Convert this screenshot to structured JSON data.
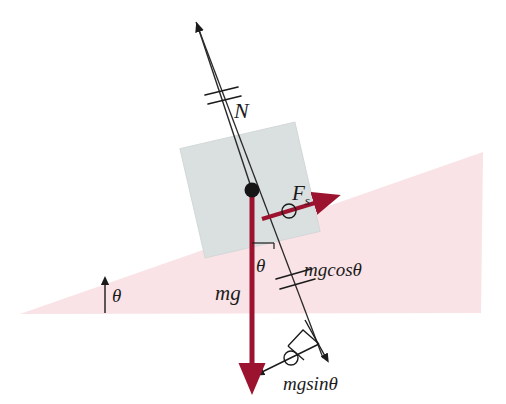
{
  "figure": {
    "domain": "physics-diagram"
  },
  "colors": {
    "incline_fill": "#f9e3e6",
    "block_fill": "#dadfe0",
    "block_stroke": "#c9cfd0",
    "force_red": "#9c1330",
    "line_black": "#1b1b1b",
    "background": "#ffffff"
  },
  "labels": {
    "normal_force": "N",
    "friction_force": "F",
    "friction_force_sub": "s",
    "weight": "mg",
    "weight_cos": "mgcosθ",
    "weight_sin": "mgsinθ",
    "angle_incline": "θ",
    "angle_weight": "θ"
  },
  "vectors": [
    {
      "name": "normal-force",
      "label": "N",
      "color": "#1b1b1b",
      "direction": "up-left",
      "tick_marks": 2,
      "from": [
        252,
        190
      ],
      "to": [
        196,
        22
      ]
    },
    {
      "name": "weight",
      "label": "mg",
      "color": "#9c1330",
      "direction": "down",
      "tick_marks": 0,
      "from": [
        252,
        190
      ],
      "to": [
        252,
        376
      ]
    },
    {
      "name": "static-friction",
      "label": "Fs",
      "color": "#9c1330",
      "direction": "up-right-along-incline",
      "tick_marks": 1,
      "from": [
        264,
        215
      ],
      "to": [
        322,
        200
      ]
    },
    {
      "name": "weight-component-perpendicular",
      "label": "mgcosθ",
      "color": "#1b1b1b",
      "direction": "down-right-perpendicular",
      "tick_marks": 2,
      "from": [
        252,
        190
      ],
      "to": [
        320,
        358
      ]
    },
    {
      "name": "weight-component-parallel",
      "label": "mgsinθ",
      "color": "#1b1b1b",
      "direction": "down-left-along-incline",
      "tick_marks": 1,
      "from": [
        320,
        358
      ],
      "to": [
        256,
        375
      ]
    },
    {
      "name": "incline-angle-indicator",
      "label": "θ",
      "color": "#1b1b1b",
      "direction": "up",
      "tick_marks": 0,
      "from": [
        105,
        313
      ],
      "to": [
        105,
        280
      ]
    }
  ],
  "shapes": {
    "incline": {
      "name": "inclined-plane",
      "fill": "#f9e3e6",
      "points": "20,314 483,152 481,313"
    },
    "block": {
      "name": "block",
      "fill": "#dadfe0",
      "rotation_deg": -13,
      "center": [
        250,
        190
      ],
      "width": 118,
      "height": 112
    },
    "pivot_dot": {
      "name": "center-of-mass-dot",
      "color": "#151515",
      "center": [
        252,
        190
      ],
      "radius": 7
    },
    "right_angle_marker": {
      "name": "right-angle-marker",
      "at": [
        305,
        352
      ]
    }
  }
}
